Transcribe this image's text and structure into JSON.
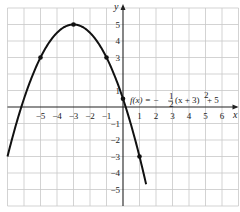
{
  "chart_data": {
    "type": "line",
    "title": "",
    "function_label": "f(x) = −½ (x + 3)² + 5",
    "function_parts": {
      "lhs": "f(x) = −",
      "frac_num": "1",
      "frac_den": "2",
      "rest": "(x + 3)",
      "exp": "2",
      "tail": " + 5"
    },
    "xlabel": "x",
    "ylabel": "y",
    "xlim": [
      -7,
      7
    ],
    "ylim": [
      -6,
      6
    ],
    "grid": true,
    "x_ticks": [
      -5,
      -4,
      -3,
      -2,
      -1,
      1,
      2,
      3,
      4,
      5,
      6
    ],
    "x_tick_labels": [
      "−5",
      "−4",
      "−3",
      "−2",
      "−1",
      "1",
      "2",
      "3",
      "4",
      "5",
      "6"
    ],
    "y_ticks": [
      5,
      4,
      3,
      1,
      -1,
      -2,
      -3,
      -4,
      -5
    ],
    "y_tick_labels": [
      "5",
      "4",
      "3",
      "1",
      "−1",
      "−2",
      "−3",
      "−4",
      "−5"
    ],
    "series": [
      {
        "name": "f(x) = -1/2 (x+3)^2 + 5",
        "a": -0.5,
        "h": -3,
        "k": 5,
        "x_range": [
          -7,
          1.4
        ],
        "marked_points": [
          {
            "x": -5,
            "y": 3
          },
          {
            "x": -3,
            "y": 5
          },
          {
            "x": -1,
            "y": 3
          },
          {
            "x": 0,
            "y": 0.5
          },
          {
            "x": 1,
            "y": -3
          }
        ]
      }
    ],
    "colors": {
      "grid": "#c8c8c8",
      "axis": "#222222",
      "curve": "#111111"
    }
  }
}
